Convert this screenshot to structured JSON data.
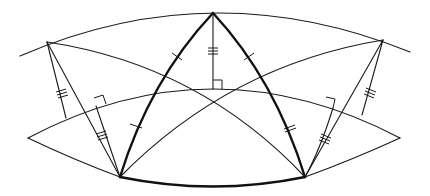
{
  "diagram": {
    "type": "spherical-geometry-construction",
    "colors": {
      "stroke": "#1a1a1a",
      "background": "#ffffff"
    },
    "points": {
      "apex_top": [
        213,
        13
      ],
      "upper_left": [
        47,
        42
      ],
      "upper_right": [
        383,
        40
      ],
      "bottom_left": [
        120,
        177
      ],
      "bottom_right": [
        305,
        177
      ],
      "lens_left_tip": [
        28,
        138
      ],
      "lens_right_tip": [
        400,
        138
      ],
      "altitude_foot_top": [
        213,
        89
      ],
      "perp_foot_left": [
        62,
        117
      ],
      "perp_foot_right": [
        362,
        113
      ],
      "perp_foot_left_inner": [
        97,
        105
      ],
      "perp_foot_right_inner": [
        328,
        107
      ]
    },
    "tick_marks": {
      "single": "apex-to-bottom arcs",
      "double": "altitude from apex and inner perpendiculars",
      "triple": "outer slanted segments"
    },
    "right_angle_markers": 3,
    "labels": []
  }
}
